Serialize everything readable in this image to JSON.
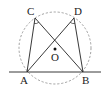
{
  "diagram": {
    "type": "geometry",
    "colors": {
      "stroke": "#222222",
      "circle": "#888888",
      "background": "#ffffff"
    },
    "circle": {
      "center": "O",
      "cx": 55,
      "cy": 48,
      "r": 36,
      "style": "dashed"
    },
    "points": {
      "A": {
        "label": "A",
        "x": 27,
        "y": 72
      },
      "B": {
        "label": "B",
        "x": 83,
        "y": 72
      },
      "C": {
        "label": "C",
        "x": 35,
        "y": 18
      },
      "D": {
        "label": "D",
        "x": 74,
        "y": 18
      },
      "O": {
        "label": "O",
        "x": 55,
        "y": 49
      }
    },
    "segments": [
      "AC",
      "AD",
      "BC",
      "BD",
      "AB"
    ],
    "baseline": {
      "x1": 9,
      "x2": 101,
      "y": 72
    },
    "angle_marks": [
      "C",
      "D"
    ]
  }
}
